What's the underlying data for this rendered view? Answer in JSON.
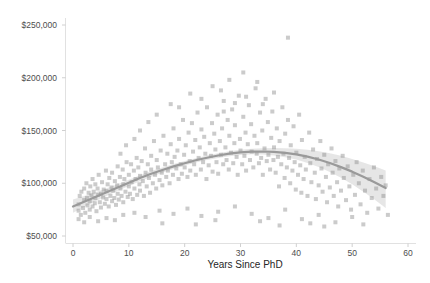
{
  "chart_data": {
    "type": "scatter",
    "title": "",
    "subtitle": "",
    "xlabel": "Years Since PhD",
    "ylabel": "",
    "xlim": [
      -2,
      60
    ],
    "ylim": [
      40000,
      255000
    ],
    "grid": false,
    "legend": null,
    "xticks": [
      0,
      10,
      20,
      30,
      40,
      50,
      60
    ],
    "xtick_labels": [
      "0",
      "10",
      "20",
      "30",
      "40",
      "50",
      "60"
    ],
    "yticks": [
      50000,
      100000,
      150000,
      200000,
      250000
    ],
    "ytick_labels": [
      "$50,000",
      "$100,000",
      "$150,000",
      "$200,000",
      "$250,000"
    ],
    "marker": {
      "shape": "square",
      "color": "#8c8c8c",
      "size": 4,
      "opacity": 0.45
    },
    "fit": {
      "type": "loess",
      "line_color": "#9a9a9a",
      "band_color": "#bdbdbd",
      "band_label": "95% confidence interval",
      "x": [
        0,
        2,
        4,
        6,
        8,
        10,
        12,
        14,
        16,
        18,
        20,
        22,
        24,
        26,
        28,
        30,
        32,
        34,
        36,
        38,
        40,
        42,
        44,
        46,
        48,
        50,
        52,
        54,
        56
      ],
      "y": [
        78000,
        82500,
        87000,
        91500,
        96000,
        100500,
        105000,
        109000,
        112500,
        116000,
        119000,
        121800,
        124200,
        126300,
        128000,
        129300,
        130000,
        130100,
        129700,
        128800,
        127300,
        125200,
        122500,
        119200,
        115300,
        111000,
        106200,
        101000,
        95500
      ],
      "ylower": [
        72000,
        77500,
        83000,
        88000,
        92800,
        97500,
        102000,
        106200,
        110000,
        113600,
        116800,
        119600,
        122000,
        124000,
        125600,
        126800,
        127400,
        127200,
        126300,
        124700,
        122400,
        119300,
        115400,
        110700,
        105200,
        99000,
        92000,
        84500,
        76500
      ],
      "yupper": [
        84500,
        88000,
        91500,
        95200,
        99000,
        103200,
        107600,
        111600,
        115000,
        118200,
        121100,
        123800,
        126300,
        128500,
        130300,
        131700,
        132700,
        133200,
        133300,
        133200,
        132700,
        131800,
        130400,
        128500,
        126000,
        123100,
        119700,
        116000,
        112000
      ]
    },
    "points": [
      [
        1.0,
        80000
      ],
      [
        1.0,
        74000
      ],
      [
        1.2,
        88000
      ],
      [
        1.4,
        70000
      ],
      [
        1.5,
        92000
      ],
      [
        1.8,
        76500
      ],
      [
        2.0,
        84000
      ],
      [
        2.0,
        95000
      ],
      [
        2.2,
        72000
      ],
      [
        2.4,
        100000
      ],
      [
        2.5,
        86000
      ],
      [
        2.6,
        79000
      ],
      [
        2.8,
        91000
      ],
      [
        3.0,
        75000
      ],
      [
        3.0,
        83000
      ],
      [
        3.1,
        97000
      ],
      [
        3.3,
        88500
      ],
      [
        3.5,
        78000
      ],
      [
        3.5,
        104000
      ],
      [
        3.7,
        92000
      ],
      [
        3.9,
        81000
      ],
      [
        4.0,
        86000
      ],
      [
        4.0,
        99000
      ],
      [
        4.2,
        73500
      ],
      [
        4.4,
        95000
      ],
      [
        4.5,
        89000
      ],
      [
        4.6,
        108000
      ],
      [
        4.8,
        82000
      ],
      [
        5.0,
        90000
      ],
      [
        5.0,
        77000
      ],
      [
        5.2,
        101000
      ],
      [
        5.4,
        86500
      ],
      [
        5.5,
        94000
      ],
      [
        5.7,
        80500
      ],
      [
        5.9,
        112000
      ],
      [
        6.0,
        92500
      ],
      [
        6.0,
        85000
      ],
      [
        6.2,
        99000
      ],
      [
        6.4,
        78000
      ],
      [
        6.5,
        105000
      ],
      [
        6.7,
        88000
      ],
      [
        6.9,
        96000
      ],
      [
        7.0,
        83000
      ],
      [
        7.0,
        110000
      ],
      [
        7.2,
        93000
      ],
      [
        7.4,
        86000
      ],
      [
        7.5,
        102000
      ],
      [
        7.7,
        79500
      ],
      [
        7.9,
        98000
      ],
      [
        8.0,
        90000
      ],
      [
        8.0,
        116000
      ],
      [
        8.2,
        84500
      ],
      [
        8.4,
        106000
      ],
      [
        8.5,
        95000
      ],
      [
        8.7,
        88000
      ],
      [
        8.9,
        113000
      ],
      [
        9.0,
        99000
      ],
      [
        9.0,
        82000
      ],
      [
        9.2,
        104000
      ],
      [
        9.4,
        92000
      ],
      [
        9.6,
        120000
      ],
      [
        9.8,
        87000
      ],
      [
        10.0,
        97000
      ],
      [
        10.0,
        108000
      ],
      [
        10.2,
        90000
      ],
      [
        10.4,
        118000
      ],
      [
        10.5,
        101000
      ],
      [
        10.7,
        85000
      ],
      [
        10.9,
        112000
      ],
      [
        11.0,
        95000
      ],
      [
        11.2,
        104000
      ],
      [
        11.4,
        124000
      ],
      [
        11.5,
        89000
      ],
      [
        11.7,
        115000
      ],
      [
        11.9,
        99000
      ],
      [
        12.0,
        107000
      ],
      [
        12.0,
        93000
      ],
      [
        12.3,
        121000
      ],
      [
        12.5,
        102000
      ],
      [
        12.7,
        88000
      ],
      [
        12.9,
        133000
      ],
      [
        13.0,
        110000
      ],
      [
        13.2,
        97000
      ],
      [
        13.4,
        118000
      ],
      [
        13.6,
        105000
      ],
      [
        13.8,
        91000
      ],
      [
        14.0,
        126000
      ],
      [
        14.0,
        113000
      ],
      [
        14.3,
        100000
      ],
      [
        14.5,
        140000
      ],
      [
        14.7,
        108000
      ],
      [
        14.9,
        95000
      ],
      [
        15.0,
        122000
      ],
      [
        15.2,
        115000
      ],
      [
        15.5,
        103000
      ],
      [
        15.7,
        131000
      ],
      [
        15.9,
        110000
      ],
      [
        16.0,
        98000
      ],
      [
        16.2,
        145000
      ],
      [
        16.5,
        118000
      ],
      [
        16.7,
        106000
      ],
      [
        16.9,
        128000
      ],
      [
        17.0,
        112000
      ],
      [
        17.3,
        100000
      ],
      [
        17.5,
        137000
      ],
      [
        17.7,
        120000
      ],
      [
        17.9,
        108000
      ],
      [
        18.0,
        152000
      ],
      [
        18.2,
        125000
      ],
      [
        18.5,
        114000
      ],
      [
        18.7,
        131000
      ],
      [
        18.9,
        104000
      ],
      [
        19.0,
        142000
      ],
      [
        19.3,
        118000
      ],
      [
        19.5,
        109000
      ],
      [
        19.7,
        160000
      ],
      [
        19.9,
        127000
      ],
      [
        20.0,
        115000
      ],
      [
        20.2,
        136000
      ],
      [
        20.5,
        106000
      ],
      [
        20.7,
        148000
      ],
      [
        20.9,
        121000
      ],
      [
        21.0,
        112000
      ],
      [
        21.3,
        157000
      ],
      [
        21.5,
        130000
      ],
      [
        21.7,
        118000
      ],
      [
        21.9,
        141000
      ],
      [
        22.0,
        108000
      ],
      [
        22.3,
        167000
      ],
      [
        22.5,
        124000
      ],
      [
        22.7,
        134000
      ],
      [
        22.9,
        113000
      ],
      [
        23.0,
        151000
      ],
      [
        23.3,
        120000
      ],
      [
        23.5,
        144000
      ],
      [
        23.7,
        128000
      ],
      [
        23.9,
        104000
      ],
      [
        24.0,
        172000
      ],
      [
        24.3,
        117000
      ],
      [
        24.5,
        138000
      ],
      [
        24.7,
        126000
      ],
      [
        24.9,
        157000
      ],
      [
        25.0,
        111000
      ],
      [
        25.3,
        147000
      ],
      [
        25.5,
        132000
      ],
      [
        25.7,
        120000
      ],
      [
        25.9,
        165000
      ],
      [
        26.0,
        109000
      ],
      [
        26.3,
        140000
      ],
      [
        26.5,
        127000
      ],
      [
        26.7,
        152000
      ],
      [
        26.9,
        118000
      ],
      [
        27.0,
        178000
      ],
      [
        27.3,
        134000
      ],
      [
        27.5,
        122000
      ],
      [
        27.7,
        160000
      ],
      [
        27.9,
        113000
      ],
      [
        28.0,
        145000
      ],
      [
        28.3,
        129000
      ],
      [
        28.5,
        170000
      ],
      [
        28.7,
        119000
      ],
      [
        28.9,
        138000
      ],
      [
        29.0,
        155000
      ],
      [
        29.3,
        125000
      ],
      [
        29.5,
        108000
      ],
      [
        29.7,
        183000
      ],
      [
        29.9,
        142000
      ],
      [
        30.0,
        131000
      ],
      [
        30.3,
        118000
      ],
      [
        30.5,
        163000
      ],
      [
        30.7,
        126000
      ],
      [
        30.9,
        148000
      ],
      [
        31.0,
        112000
      ],
      [
        31.3,
        137000
      ],
      [
        31.5,
        174000
      ],
      [
        31.7,
        122000
      ],
      [
        31.9,
        156000
      ],
      [
        32.0,
        130000
      ],
      [
        32.3,
        115000
      ],
      [
        32.5,
        145000
      ],
      [
        32.7,
        190000
      ],
      [
        32.9,
        128000
      ],
      [
        33.0,
        138000
      ],
      [
        33.3,
        119000
      ],
      [
        33.5,
        167000
      ],
      [
        33.7,
        124000
      ],
      [
        33.9,
        150000
      ],
      [
        34.0,
        108000
      ],
      [
        34.3,
        133000
      ],
      [
        34.5,
        180000
      ],
      [
        34.7,
        121000
      ],
      [
        34.9,
        158000
      ],
      [
        35.0,
        127000
      ],
      [
        35.3,
        113000
      ],
      [
        35.5,
        143000
      ],
      [
        35.7,
        168000
      ],
      [
        35.9,
        122000
      ],
      [
        36.0,
        134000
      ],
      [
        36.3,
        110000
      ],
      [
        36.5,
        152000
      ],
      [
        36.7,
        125000
      ],
      [
        36.9,
        97000
      ],
      [
        37.0,
        140000
      ],
      [
        37.3,
        118000
      ],
      [
        37.5,
        172000
      ],
      [
        37.7,
        128000
      ],
      [
        37.9,
        105000
      ],
      [
        38.0,
        147000
      ],
      [
        38.3,
        115000
      ],
      [
        38.5,
        160000
      ],
      [
        38.5,
        238000
      ],
      [
        38.7,
        124000
      ],
      [
        38.9,
        100000
      ],
      [
        39.0,
        136000
      ],
      [
        39.3,
        112000
      ],
      [
        39.5,
        154000
      ],
      [
        39.7,
        120000
      ],
      [
        39.9,
        94000
      ],
      [
        40.0,
        129000
      ],
      [
        40.3,
        108000
      ],
      [
        40.5,
        165000
      ],
      [
        40.7,
        117000
      ],
      [
        40.9,
        91000
      ],
      [
        41.0,
        141000
      ],
      [
        41.3,
        104000
      ],
      [
        41.5,
        125000
      ],
      [
        41.7,
        113000
      ],
      [
        42.0,
        88000
      ],
      [
        42.3,
        148000
      ],
      [
        42.5,
        119000
      ],
      [
        42.7,
        101000
      ],
      [
        43.0,
        132000
      ],
      [
        43.3,
        110000
      ],
      [
        43.5,
        85000
      ],
      [
        43.7,
        123000
      ],
      [
        44.0,
        98000
      ],
      [
        44.3,
        140000
      ],
      [
        44.5,
        114000
      ],
      [
        44.7,
        92000
      ],
      [
        45.0,
        127000
      ],
      [
        45.3,
        106000
      ],
      [
        45.5,
        82000
      ],
      [
        45.7,
        118000
      ],
      [
        46.0,
        96000
      ],
      [
        46.3,
        133000
      ],
      [
        46.5,
        110000
      ],
      [
        46.7,
        88000
      ],
      [
        47.0,
        121000
      ],
      [
        47.3,
        101000
      ],
      [
        47.5,
        78000
      ],
      [
        47.7,
        114000
      ],
      [
        48.0,
        93000
      ],
      [
        48.3,
        126000
      ],
      [
        48.5,
        105000
      ],
      [
        48.9,
        84000
      ],
      [
        49.2,
        116000
      ],
      [
        49.5,
        97000
      ],
      [
        49.8,
        75000
      ],
      [
        50.2,
        108000
      ],
      [
        50.5,
        89000
      ],
      [
        50.8,
        120000
      ],
      [
        51.2,
        100000
      ],
      [
        51.5,
        80000
      ],
      [
        51.9,
        112000
      ],
      [
        52.3,
        93000
      ],
      [
        52.7,
        72000
      ],
      [
        53.1,
        104000
      ],
      [
        53.5,
        86000
      ],
      [
        53.9,
        115000
      ],
      [
        54.3,
        95000
      ],
      [
        54.7,
        76000
      ],
      [
        55.2,
        106000
      ],
      [
        55.6,
        88000
      ],
      [
        56.0,
        98000
      ],
      [
        56.4,
        70000
      ],
      [
        15.0,
        165000
      ],
      [
        17.5,
        175000
      ],
      [
        21.0,
        185000
      ],
      [
        25.0,
        192000
      ],
      [
        28.0,
        198000
      ],
      [
        30.5,
        205000
      ],
      [
        33.0,
        196000
      ],
      [
        19.0,
        172000
      ],
      [
        23.0,
        180000
      ],
      [
        26.5,
        188000
      ],
      [
        12.0,
        150000
      ],
      [
        13.5,
        158000
      ],
      [
        11.0,
        142000
      ],
      [
        9.5,
        136000
      ],
      [
        8.5,
        128000
      ],
      [
        36.0,
        186000
      ],
      [
        34.0,
        175000
      ],
      [
        31.0,
        182000
      ],
      [
        29.0,
        176000
      ],
      [
        27.0,
        168000
      ],
      [
        1.0,
        66000
      ],
      [
        2.0,
        63000
      ],
      [
        3.0,
        68000
      ],
      [
        4.5,
        64000
      ],
      [
        6.0,
        67000
      ],
      [
        7.5,
        65000
      ],
      [
        9.0,
        70000
      ],
      [
        11.0,
        72000
      ],
      [
        13.0,
        68000
      ],
      [
        15.5,
        74000
      ],
      [
        18.0,
        71000
      ],
      [
        20.5,
        76000
      ],
      [
        23.0,
        69000
      ],
      [
        26.0,
        73000
      ],
      [
        29.0,
        78000
      ],
      [
        32.0,
        71000
      ],
      [
        35.0,
        67000
      ],
      [
        38.0,
        75000
      ],
      [
        41.0,
        66000
      ],
      [
        44.0,
        70000
      ],
      [
        47.0,
        63000
      ],
      [
        50.0,
        68000
      ],
      [
        22.0,
        61000
      ],
      [
        33.5,
        64000
      ],
      [
        42.5,
        62000
      ],
      [
        16.0,
        62000
      ],
      [
        25.5,
        65000
      ],
      [
        37.0,
        60000
      ],
      [
        45.0,
        59000
      ],
      [
        52.0,
        61000
      ]
    ]
  },
  "axes": {
    "y_axis_name": "salary-axis",
    "x_axis_name": "years-axis"
  }
}
